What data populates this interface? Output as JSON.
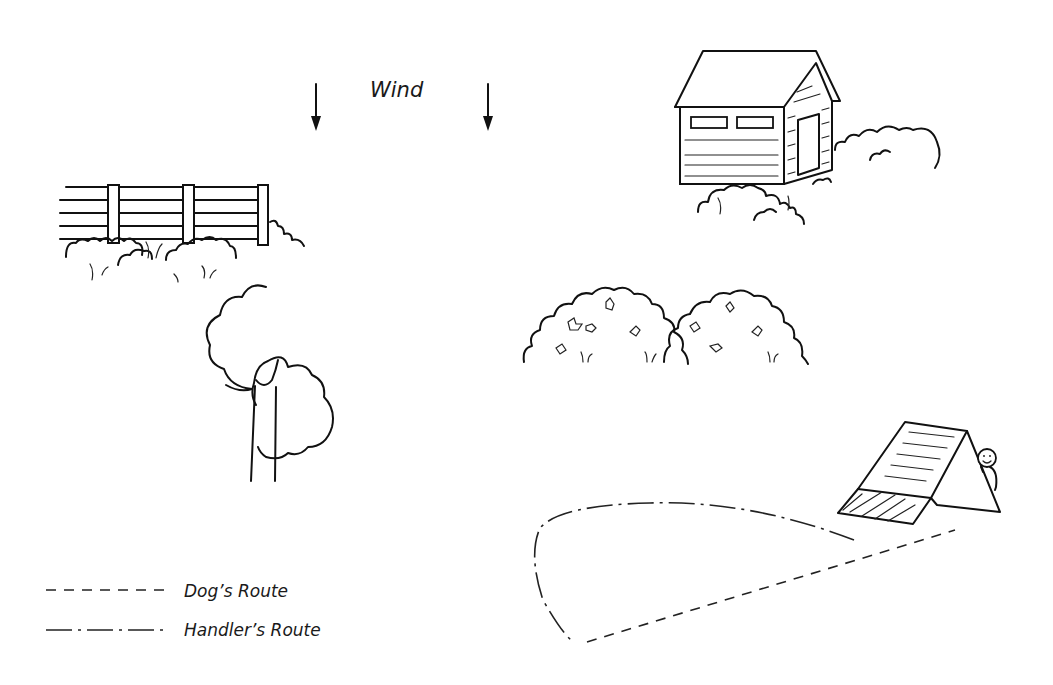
{
  "scene": {
    "title_label": "Wind",
    "wind_arrows": 2,
    "elements": [
      "fence",
      "shed",
      "tree",
      "bushes",
      "a-frame",
      "handler"
    ],
    "colors": {
      "ink": "#111111",
      "background": "#ffffff"
    }
  },
  "legend": {
    "items": [
      {
        "style": "dashed",
        "label": "Dog’s Route"
      },
      {
        "style": "dash-dot",
        "label": "Handler’s Route"
      }
    ]
  }
}
